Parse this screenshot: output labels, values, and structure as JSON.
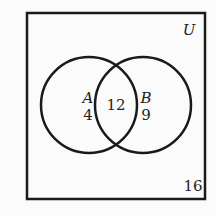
{
  "diagram": {
    "type": "venn",
    "universe_label": "U",
    "sets": [
      {
        "name": "A",
        "only_count": "4"
      },
      {
        "name": "B",
        "only_count": "9"
      }
    ],
    "intersection_count": "12",
    "outside_count": "16"
  }
}
